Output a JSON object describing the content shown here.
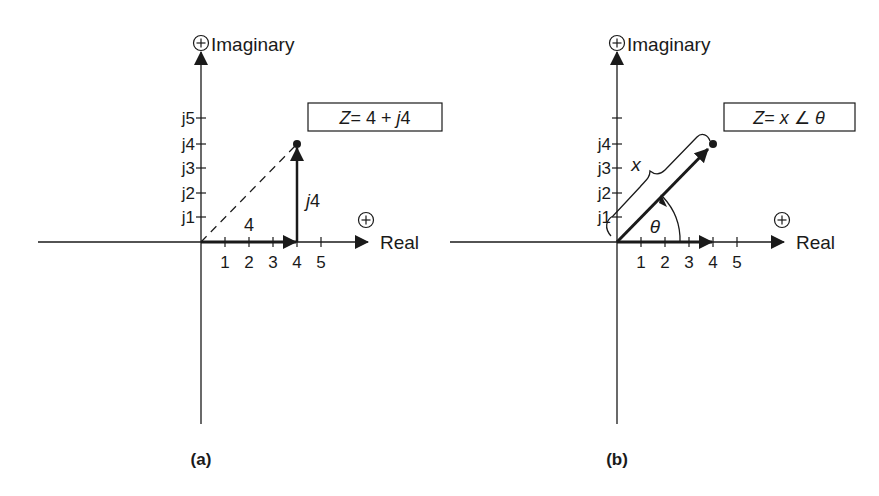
{
  "colors": {
    "ink": "#1a1a1a",
    "background": "#ffffff"
  },
  "diagram_a": {
    "caption": "(a)",
    "imag_axis_label": "Imaginary",
    "real_axis_label": "Real",
    "plus_sign": "+",
    "real_ticks": [
      "1",
      "2",
      "3",
      "4",
      "5"
    ],
    "imag_ticks": [
      "j1",
      "j2",
      "j3",
      "j4",
      "j5"
    ],
    "equation_box": {
      "lhs": "Z",
      "rhs": "= 4 + ",
      "j": "j",
      "j_val": "4"
    },
    "real_component_label": "4",
    "imag_component_label_j": "j",
    "imag_component_label_val": "4",
    "point": {
      "real": 4,
      "imag": 4
    }
  },
  "diagram_b": {
    "caption": "(b)",
    "imag_axis_label": "Imaginary",
    "real_axis_label": "Real",
    "plus_sign": "+",
    "real_ticks": [
      "1",
      "2",
      "3",
      "4",
      "5"
    ],
    "imag_ticks": [
      "j1",
      "j2",
      "j3",
      "j4"
    ],
    "equation_box": {
      "lhs": "Z",
      "eq": "= ",
      "x": "x",
      "angle": " ∠ ",
      "theta": "θ"
    },
    "magnitude_label": "x",
    "angle_label": "θ",
    "point": {
      "real": 4,
      "imag": 4
    }
  }
}
